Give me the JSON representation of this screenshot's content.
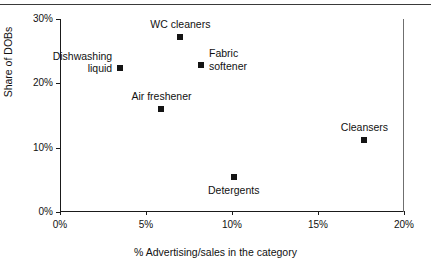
{
  "chart_data": {
    "type": "scatter",
    "title": "",
    "xlabel": "% Advertising/sales in the category",
    "ylabel": "Share of DOBs",
    "xlim": [
      0,
      20
    ],
    "ylim": [
      0,
      30
    ],
    "grid": false,
    "legend": "none",
    "marker_style": "filled-square",
    "marker_color": "#141414",
    "xticks": [
      {
        "value": 0,
        "label": "0%"
      },
      {
        "value": 5,
        "label": "5%"
      },
      {
        "value": 10,
        "label": "10%"
      },
      {
        "value": 15,
        "label": "15%"
      },
      {
        "value": 20,
        "label": "20%"
      }
    ],
    "yticks": [
      {
        "value": 0,
        "label": "0%"
      },
      {
        "value": 10,
        "label": "10%"
      },
      {
        "value": 20,
        "label": "20%"
      },
      {
        "value": 30,
        "label": "30%"
      }
    ],
    "points": [
      {
        "label": "WC cleaners",
        "x": 7.0,
        "y": 27.2,
        "label_pos": "above",
        "label_dx": 0,
        "label_dy": -7
      },
      {
        "label": "Dishwashing\nliquid",
        "x": 3.5,
        "y": 22.4,
        "label_pos": "left",
        "label_dx": -8,
        "label_dy": -6
      },
      {
        "label": "Fabric\nsoftener",
        "x": 8.2,
        "y": 22.8,
        "label_pos": "right",
        "label_dx": 8,
        "label_dy": -6
      },
      {
        "label": "Air freshener",
        "x": 5.9,
        "y": 16.0,
        "label_pos": "above",
        "label_dx": 0,
        "label_dy": -7
      },
      {
        "label": "Cleansers",
        "x": 17.7,
        "y": 11.2,
        "label_pos": "above",
        "label_dx": 0,
        "label_dy": -7
      },
      {
        "label": "Detergents",
        "x": 10.1,
        "y": 5.5,
        "label_pos": "below",
        "label_dx": 0,
        "label_dy": 7
      }
    ]
  }
}
